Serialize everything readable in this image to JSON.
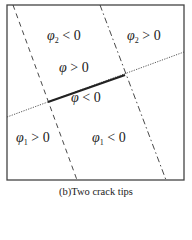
{
  "diagram": {
    "caption": "(b)Two crack tips",
    "frame": {
      "x": 7,
      "y": 5,
      "width": 177,
      "height": 175
    },
    "lines": [
      {
        "name": "phi1-level-set",
        "style": "dashed",
        "from": [
          13,
          5
        ],
        "to": [
          77,
          180
        ]
      },
      {
        "name": "phi2-level-set",
        "style": "dash-dot",
        "from": [
          100,
          5
        ],
        "to": [
          166,
          180
        ]
      },
      {
        "name": "crack-extension",
        "style": "dotted",
        "from": [
          7,
          117
        ],
        "to": [
          184,
          52
        ]
      },
      {
        "name": "crack",
        "style": "solid",
        "from": [
          48,
          102
        ],
        "to": [
          125,
          75
        ]
      }
    ],
    "labels": {
      "phi2_neg": {
        "sym": "φ",
        "sub": "2",
        "rel": " < 0"
      },
      "phi2_pos": {
        "sym": "φ",
        "sub": "2",
        "rel": " > 0"
      },
      "varphi_pos": {
        "sym": "φ",
        "rel": " > 0"
      },
      "varphi_neg": {
        "sym": "φ",
        "rel": " < 0"
      },
      "phi1_pos": {
        "sym": "φ",
        "sub": "1",
        "rel": " > 0"
      },
      "phi1_neg": {
        "sym": "φ",
        "sub": "1",
        "rel": " < 0"
      }
    },
    "colors": {
      "line": "#333333",
      "crack": "#222222",
      "text": "#222222"
    }
  }
}
